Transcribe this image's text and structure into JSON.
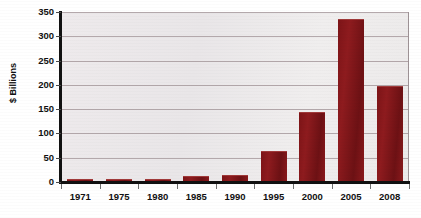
{
  "chart_data": {
    "type": "bar",
    "title": "",
    "xlabel": "",
    "ylabel": "$ Billions",
    "categories": [
      "1971",
      "1975",
      "1980",
      "1985",
      "1990",
      "1995",
      "2000",
      "2005",
      "2008"
    ],
    "values": [
      2,
      2,
      5,
      10,
      12,
      61,
      143,
      333,
      196
    ],
    "ylim": [
      0,
      350
    ],
    "yticks": [
      0,
      50,
      100,
      150,
      200,
      250,
      300,
      350
    ],
    "ytick_labels": [
      "0",
      "50",
      "100",
      "150",
      "200",
      "250",
      "300",
      "350"
    ],
    "grid": true,
    "legend": false,
    "series": [
      {
        "name": "",
        "values": [
          2,
          2,
          5,
          10,
          12,
          61,
          143,
          333,
          196
        ]
      }
    ],
    "colors": {
      "bar": "#8b1a1e",
      "plot_background": "#eceaea",
      "gridline": "#a99ca0",
      "axis": "#111111",
      "text": "#111111",
      "page_background": "#ffffff"
    }
  }
}
